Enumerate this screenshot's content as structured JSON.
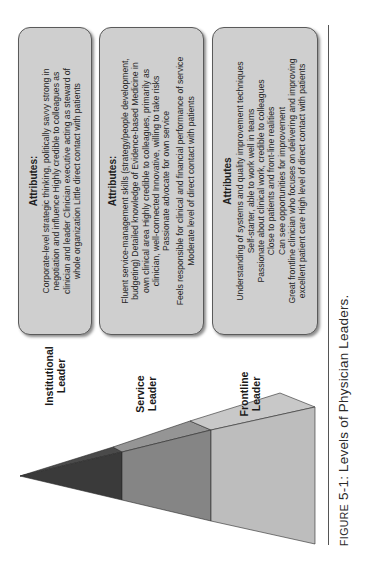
{
  "figure": {
    "caption_prefix_smallcaps": "FIGURE",
    "caption_number": "5-1:",
    "caption_title": "Levels of Physician Leaders."
  },
  "levels": [
    {
      "label_line1": "Institutional",
      "label_line2": "Leader",
      "shade": "#3a3a3a",
      "top_shade": "#4a4a4a",
      "attributes_title": "Attributes:",
      "attributes_lines": [
        "Corporate-level strategic thinking, politically savvy strong in",
        "negotiation and influence Highly credible to colleagues as",
        "clinician and leader Clinician executive acting as steward of",
        "whole organization Little direct contact with patients"
      ]
    },
    {
      "label_line1": "Service",
      "label_line2": "Leader",
      "shade": "#858585",
      "top_shade": "#959595",
      "attributes_title": "Attributes:",
      "attributes_lines": [
        "Fluent service-management skills (strategy/people development,",
        "budgeting) Detailed knowledge of Evidence-based Medicine in",
        "own clinical area Highly credible to colleagues, primarily as",
        "clinician, well-connected Innovative, willing to take risks",
        "Passionate advocate for own service",
        "",
        "Feels responsible for clinical and financial performance of service",
        "Moderate level of direct contact with patients"
      ]
    },
    {
      "label_line1": "Frontline",
      "label_line2": "Leader",
      "shade": "#bdbdbd",
      "top_shade": "#c8c8c8",
      "attributes_title": "Attributes",
      "attributes_lines": [
        "Understanding of systems and quality improvement techniques",
        "Self-starter, able to work well in teams",
        "Passionate about clinical work, credible to colleagues",
        "Close to patients and front-line realities",
        "Can see opportunities for improvement",
        "Great frontline clinician who focuses on delivering and improving",
        "excellent patient care High level of direct contact with patients"
      ]
    }
  ]
}
